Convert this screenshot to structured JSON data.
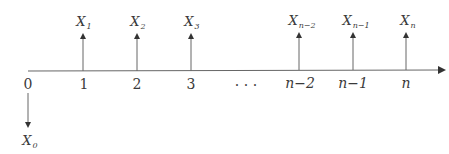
{
  "diagram": {
    "type": "cash-flow timeline",
    "axis": {
      "start_label": "0",
      "arrow": "right"
    },
    "periods": [
      {
        "label": "1",
        "flow_label": "X",
        "flow_sub": "1",
        "direction": "up"
      },
      {
        "label": "2",
        "flow_label": "X",
        "flow_sub": "2",
        "direction": "up"
      },
      {
        "label": "3",
        "flow_label": "X",
        "flow_sub": "3",
        "direction": "up"
      },
      {
        "label": "n−2",
        "flow_label": "X",
        "flow_sub": "n−2",
        "direction": "up"
      },
      {
        "label": "n−1",
        "flow_label": "X",
        "flow_sub": "n−1",
        "direction": "up"
      },
      {
        "label": "n",
        "flow_label": "X",
        "flow_sub": "n",
        "direction": "up"
      }
    ],
    "ellipsis": ". . .",
    "initial": {
      "label": "0",
      "flow_label": "X",
      "flow_sub": "0",
      "direction": "down"
    },
    "colors": {
      "line": "#555555",
      "text": "#3a3a3a"
    }
  }
}
